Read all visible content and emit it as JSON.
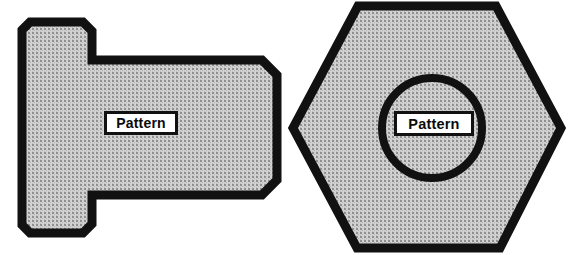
{
  "figure": {
    "background_color": "#ffffff",
    "outline_color": "#111111",
    "fill_color": "#c8c8c8",
    "fill_description": "fine dotted screen-tone texture",
    "shapes": [
      {
        "id": "stepped-polygon",
        "name": "stepped-chamfered-polygon",
        "description": "Left shape: tall chamfered block on the left with a wider chamfered block extending to the right, forming a stepped T profile",
        "outline_width_px": 9,
        "label": {
          "text": "Pattern",
          "box_color": "#ffffff",
          "border_color": "#111111"
        }
      },
      {
        "id": "hexagon",
        "name": "regular-hexagon",
        "description": "Right shape: a flat-top hexagon with a heavy circular ring inscribed at its center",
        "outline_width_px": 9,
        "inner_circle": {
          "name": "inner-ring",
          "center_x": 432,
          "center_y": 128,
          "radius_px": 50,
          "stroke_width_px": 8,
          "stroke_color": "#111111"
        },
        "label": {
          "text": "Pattern",
          "box_color": "#ffffff",
          "border_color": "#111111"
        }
      }
    ]
  },
  "labels": {
    "left_shape_label": "Pattern",
    "right_shape_label": "Pattern"
  }
}
